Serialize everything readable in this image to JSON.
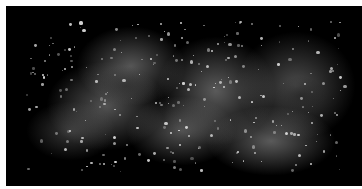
{
  "image": {
    "description": "Grayscale fluorescence-like image of an irregular elongated mass with bright speckles on a black background",
    "background": "#000000",
    "border": "#ffffff",
    "blobs": [
      {
        "x": 40,
        "y": 55,
        "w": 120,
        "h": 90,
        "c": "rgba(150,150,150,0.55)"
      },
      {
        "x": 70,
        "y": 20,
        "w": 110,
        "h": 80,
        "c": "rgba(170,170,170,0.5)"
      },
      {
        "x": 150,
        "y": 30,
        "w": 120,
        "h": 110,
        "c": "rgba(180,180,180,0.5)"
      },
      {
        "x": 230,
        "y": 25,
        "w": 120,
        "h": 110,
        "c": "rgba(150,150,150,0.5)"
      },
      {
        "x": 200,
        "y": 100,
        "w": 130,
        "h": 70,
        "c": "rgba(200,200,200,0.45)"
      },
      {
        "x": 120,
        "y": 90,
        "w": 110,
        "h": 70,
        "c": "rgba(160,160,160,0.5)"
      },
      {
        "x": 20,
        "y": 95,
        "w": 90,
        "h": 60,
        "c": "rgba(120,120,120,0.45)"
      },
      {
        "x": 90,
        "y": 60,
        "w": 60,
        "h": 40,
        "c": "rgba(40,40,40,0.6)"
      },
      {
        "x": 270,
        "y": 70,
        "w": 50,
        "h": 40,
        "c": "rgba(30,30,30,0.6)"
      }
    ]
  }
}
